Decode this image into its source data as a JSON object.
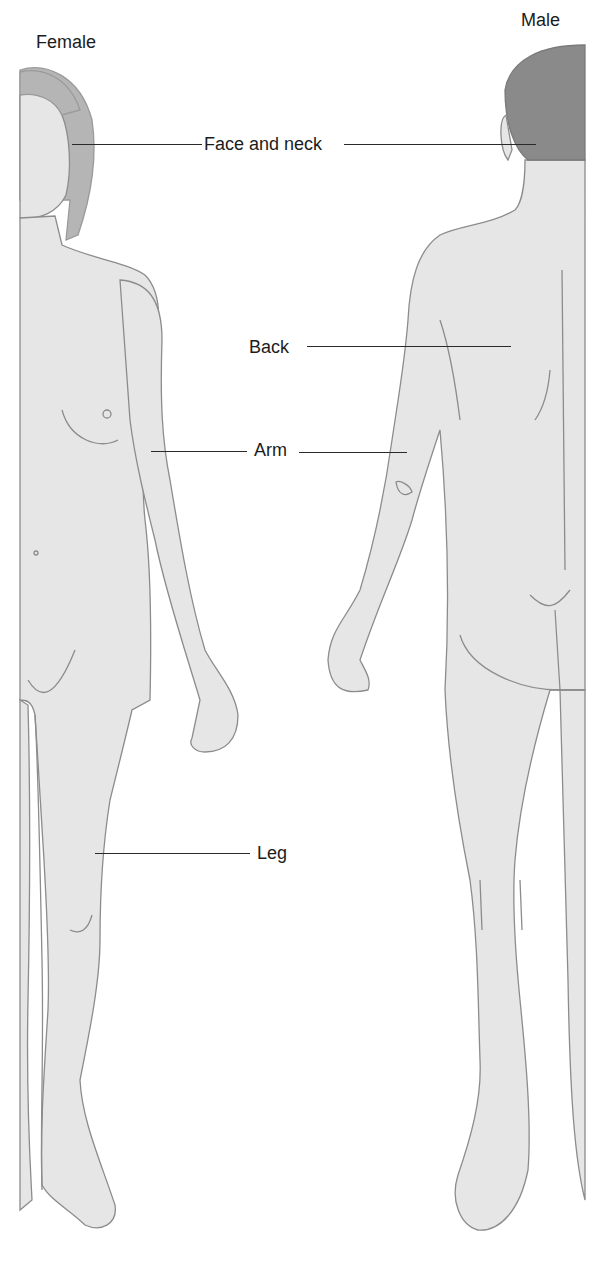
{
  "diagram": {
    "figures": [
      {
        "id": "female",
        "title": "Female",
        "view": "anterior"
      },
      {
        "id": "male",
        "title": "Male",
        "view": "posterior"
      }
    ],
    "labels": [
      {
        "id": "face-and-neck",
        "text": "Face and neck"
      },
      {
        "id": "back",
        "text": "Back"
      },
      {
        "id": "arm",
        "text": "Arm"
      },
      {
        "id": "leg",
        "text": "Leg"
      }
    ],
    "colors": {
      "skin": "#e6e6e6",
      "outline": "#8c8c8c",
      "female_hair": "#b5b5b5",
      "male_hair": "#8a8a8a",
      "leader_line": "#2a2a2a",
      "background": "#ffffff"
    }
  }
}
